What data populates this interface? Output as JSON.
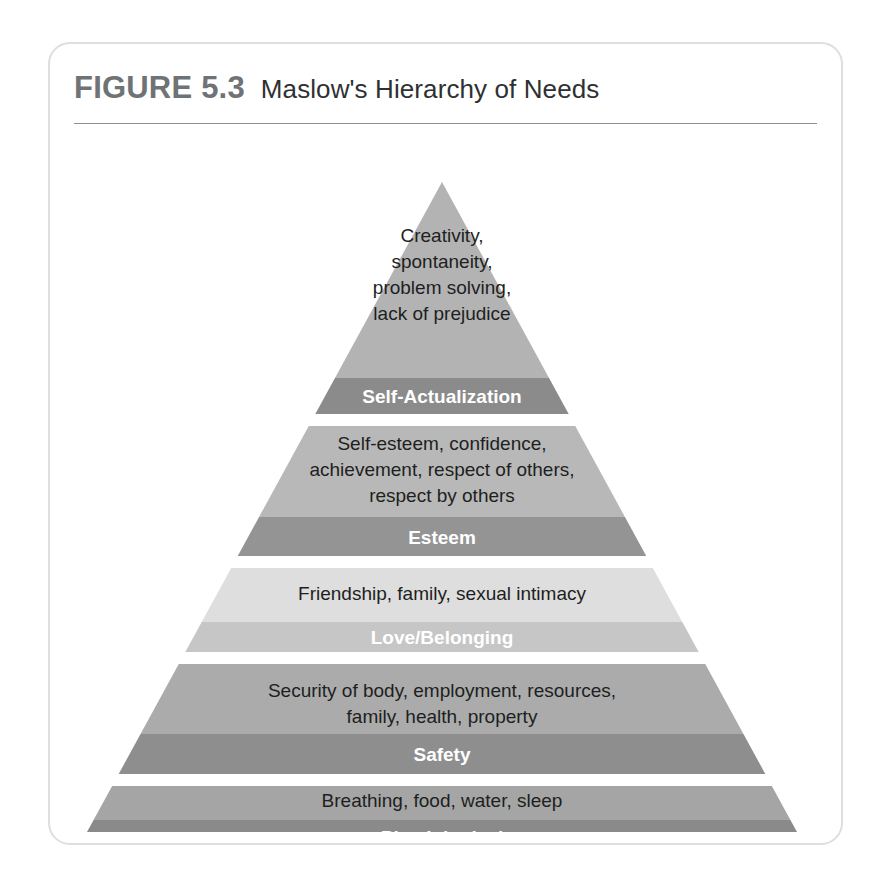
{
  "figure": {
    "number": "FIGURE 5.3",
    "title": "Maslow's Hierarchy of Needs"
  },
  "chart_data": {
    "type": "pyramid",
    "title": "Maslow's Hierarchy of Needs",
    "orientation": "apex-up",
    "tier_count": 5,
    "levels": [
      {
        "rank": 5,
        "label": "Self-Actualization",
        "description": "Creativity, spontaneity, problem solving, lack of prejudice",
        "description_lines": [
          "Creativity,",
          "spontaneity,",
          "problem solving,",
          "lack of prejudice"
        ],
        "body_color": "#b3b3b3",
        "band_color": "#8b8b8b",
        "label_color": "#ffffff"
      },
      {
        "rank": 4,
        "label": "Esteem",
        "description": "Self-esteem, confidence, achievement, respect of others, respect by others",
        "description_lines": [
          "Self-esteem, confidence,",
          "achievement, respect of others,",
          "respect by others"
        ],
        "body_color": "#b8b8b8",
        "band_color": "#949494",
        "label_color": "#ffffff"
      },
      {
        "rank": 3,
        "label": "Love/Belonging",
        "description": "Friendship, family, sexual intimacy",
        "description_lines": [
          "Friendship, family, sexual intimacy"
        ],
        "body_color": "#dedede",
        "band_color": "#c6c6c6",
        "label_color": "#ffffff"
      },
      {
        "rank": 2,
        "label": "Safety",
        "description": "Security of body, employment, resources, family, health, property",
        "description_lines": [
          "Security of body, employment, resources,",
          "family, health, property"
        ],
        "body_color": "#ababab",
        "band_color": "#8e8e8e",
        "label_color": "#ffffff"
      },
      {
        "rank": 1,
        "label": "Physiological",
        "description": "Breathing, food, water, sleep",
        "description_lines": [
          "Breathing, food, water, sleep"
        ],
        "body_color": "#a5a5a5",
        "band_color": "#8a8a8a",
        "label_color": "#ffffff"
      }
    ]
  }
}
